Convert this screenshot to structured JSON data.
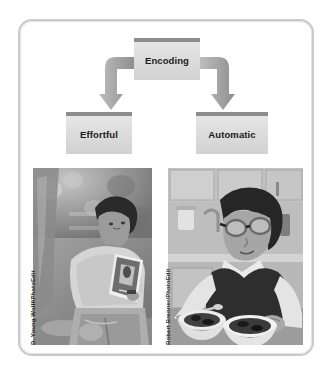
{
  "figure": {
    "type": "flow-diagram",
    "title_box": {
      "label": "Encoding"
    },
    "branches": [
      {
        "label": "Effortful"
      },
      {
        "label": "Automatic"
      }
    ],
    "arrows": [
      {
        "name": "arrow-to-effortful",
        "direction": "down-left"
      },
      {
        "name": "arrow-to-automatic",
        "direction": "down-right"
      }
    ],
    "photos": [
      {
        "name": "photo-effortful",
        "credit": "D. Young Wolff/PhotoEdit",
        "description": "Person sitting outdoors under a tree reading a book"
      },
      {
        "name": "photo-automatic",
        "credit": "Robert Brenner/PhotoEdit",
        "description": "Person wearing glasses eating from bowls in a kitchen"
      }
    ],
    "colors": {
      "box_top_bar": "#8d8d8d",
      "box_body": "#dcdcdc",
      "arrow": "#a6a6a6",
      "frame_border": "#c9c9c9",
      "text": "#1a1a1a"
    }
  }
}
